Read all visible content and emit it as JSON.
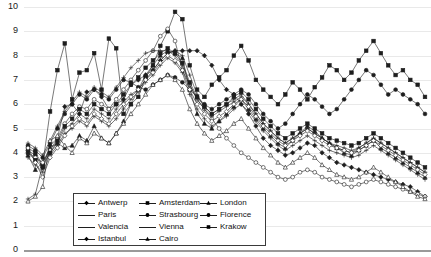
{
  "chart_data": {
    "type": "line",
    "title": "",
    "xlabel": "",
    "ylabel": "",
    "ylim": [
      0,
      10
    ],
    "ytick_values": [
      0,
      1,
      2,
      3,
      4,
      5,
      6,
      7,
      8,
      9,
      10
    ],
    "grid": true,
    "legend_position": "lower-left-inside",
    "x_axis_labels_visible": false,
    "n_points": 55,
    "x": [
      1,
      2,
      3,
      4,
      5,
      6,
      7,
      8,
      9,
      10,
      11,
      12,
      13,
      14,
      15,
      16,
      17,
      18,
      19,
      20,
      21,
      22,
      23,
      24,
      25,
      26,
      27,
      28,
      29,
      30,
      31,
      32,
      33,
      34,
      35,
      36,
      37,
      38,
      39,
      40,
      41,
      42,
      43,
      44,
      45,
      46,
      47,
      48,
      49,
      50,
      51,
      52,
      53,
      54,
      55
    ],
    "series": [
      {
        "name": "Antwerp",
        "marker": "diamond-solid",
        "values": [
          4.1,
          3.9,
          3.4,
          4.3,
          4.6,
          5.9,
          6.0,
          5.6,
          6.5,
          6.6,
          6.3,
          5.8,
          6.0,
          6.2,
          6.8,
          7.0,
          7.2,
          7.4,
          7.8,
          8.1,
          8.2,
          8.2,
          8.2,
          8.2,
          8.0,
          7.6,
          7.0,
          6.6,
          6.4,
          6.0,
          5.6,
          5.1,
          4.6,
          4.3,
          4.1,
          3.9,
          4.0,
          4.2,
          4.4,
          4.3,
          4.0,
          3.8,
          3.6,
          3.5,
          3.4,
          3.3,
          3.2,
          3.1,
          3.0,
          2.9,
          2.8,
          2.7,
          2.6,
          2.4,
          2.2
        ]
      },
      {
        "name": "Amsterdam",
        "marker": "square-solid",
        "values": [
          4.2,
          4.0,
          3.5,
          5.7,
          7.4,
          8.5,
          6.2,
          7.3,
          7.4,
          8.1,
          6.6,
          8.7,
          8.3,
          5.6,
          6.0,
          6.3,
          7.1,
          7.6,
          8.4,
          9.0,
          9.8,
          9.5,
          7.6,
          6.6,
          6.3,
          6.8,
          7.1,
          7.4,
          8.0,
          8.4,
          7.8,
          7.0,
          6.6,
          6.3,
          6.0,
          6.4,
          6.9,
          6.6,
          6.2,
          6.7,
          7.1,
          7.6,
          7.4,
          7.0,
          7.3,
          7.8,
          8.2,
          8.6,
          8.1,
          7.6,
          7.2,
          7.4,
          7.0,
          6.8,
          6.3
        ]
      },
      {
        "name": "London",
        "marker": "triangle-solid",
        "values": [
          3.9,
          3.3,
          3.6,
          4.2,
          4.4,
          4.2,
          4.3,
          4.7,
          4.5,
          5.1,
          4.6,
          4.4,
          4.8,
          5.3,
          6.0,
          6.6,
          7.2,
          7.6,
          8.0,
          8.2,
          8.1,
          7.9,
          6.6,
          5.6,
          5.2,
          5.0,
          5.3,
          5.6,
          5.9,
          6.2,
          5.8,
          5.4,
          5.0,
          4.7,
          4.4,
          4.2,
          4.5,
          4.8,
          5.1,
          4.9,
          4.6,
          4.4,
          4.2,
          4.0,
          3.9,
          4.1,
          4.3,
          4.5,
          4.2,
          4.0,
          3.8,
          3.6,
          3.4,
          3.2,
          3.0
        ]
      },
      {
        "name": "Paris",
        "marker": "plus-line",
        "values": [
          2.1,
          2.3,
          3.5,
          4.0,
          4.4,
          5.0,
          5.2,
          5.6,
          5.4,
          5.8,
          5.6,
          5.4,
          5.8,
          6.1,
          6.4,
          6.6,
          7.0,
          7.4,
          7.8,
          8.1,
          8.2,
          8.0,
          7.2,
          6.4,
          5.9,
          5.6,
          5.8,
          6.0,
          6.2,
          6.4,
          6.0,
          5.6,
          5.2,
          4.9,
          4.6,
          4.4,
          4.6,
          4.8,
          5.0,
          4.8,
          4.6,
          4.4,
          4.2,
          4.1,
          4.0,
          4.2,
          4.4,
          4.6,
          4.4,
          4.2,
          4.0,
          3.8,
          3.6,
          3.4,
          3.2
        ]
      },
      {
        "name": "Strasbourg",
        "marker": "circle-open",
        "values": [
          4.0,
          3.8,
          3.6,
          4.1,
          4.6,
          5.2,
          5.6,
          5.9,
          5.8,
          6.2,
          6.0,
          5.8,
          6.2,
          6.6,
          7.0,
          7.4,
          7.8,
          8.2,
          8.8,
          9.1,
          8.6,
          7.4,
          6.8,
          6.2,
          5.8,
          5.4,
          5.0,
          4.6,
          4.3,
          4.0,
          3.8,
          3.6,
          3.4,
          3.2,
          3.0,
          2.9,
          3.0,
          3.2,
          3.3,
          3.2,
          3.0,
          2.9,
          2.8,
          2.7,
          2.6,
          2.7,
          2.8,
          2.9,
          2.8,
          2.7,
          2.6,
          2.5,
          2.4,
          2.3,
          2.2
        ]
      },
      {
        "name": "Florence",
        "marker": "circle-solid",
        "values": [
          4.3,
          4.1,
          3.8,
          4.4,
          5.0,
          5.6,
          6.0,
          6.4,
          6.2,
          6.6,
          6.4,
          6.2,
          6.6,
          7.0,
          6.9,
          6.7,
          6.6,
          6.8,
          7.0,
          7.2,
          7.1,
          6.9,
          6.6,
          6.3,
          6.0,
          5.8,
          6.0,
          6.2,
          6.4,
          6.6,
          6.4,
          6.0,
          5.6,
          5.3,
          5.0,
          5.2,
          5.6,
          6.0,
          6.4,
          6.2,
          5.9,
          5.6,
          5.8,
          6.2,
          6.6,
          7.0,
          7.4,
          7.2,
          6.8,
          6.4,
          6.6,
          6.4,
          6.2,
          6.0,
          5.6
        ]
      },
      {
        "name": "Valencia",
        "marker": "plus-line2",
        "values": [
          3.8,
          3.5,
          3.2,
          3.9,
          4.3,
          4.8,
          5.0,
          5.3,
          5.1,
          5.5,
          5.3,
          5.1,
          5.4,
          5.8,
          6.2,
          6.5,
          6.9,
          7.2,
          7.6,
          7.9,
          7.7,
          7.3,
          6.4,
          5.8,
          5.4,
          5.1,
          5.3,
          5.5,
          5.8,
          6.0,
          5.7,
          5.3,
          4.9,
          4.6,
          4.3,
          4.1,
          4.3,
          4.5,
          4.7,
          4.5,
          4.3,
          4.1,
          4.0,
          3.9,
          3.8,
          3.9,
          4.1,
          4.3,
          4.1,
          3.9,
          3.7,
          3.5,
          3.3,
          3.1,
          2.9
        ]
      },
      {
        "name": "Vienna",
        "marker": "plus-line3",
        "values": [
          4.4,
          4.2,
          3.9,
          4.5,
          5.1,
          5.7,
          6.1,
          6.5,
          6.3,
          6.7,
          6.5,
          6.3,
          6.7,
          7.1,
          7.5,
          7.8,
          8.1,
          8.2,
          8.2,
          8.2,
          8.0,
          7.6,
          6.8,
          6.2,
          5.8,
          5.5,
          5.7,
          5.9,
          6.1,
          6.3,
          6.0,
          5.6,
          5.2,
          4.9,
          4.6,
          4.4,
          4.6,
          4.8,
          5.0,
          4.8,
          4.6,
          4.4,
          4.3,
          4.2,
          4.1,
          4.2,
          4.4,
          4.6,
          4.4,
          4.2,
          4.0,
          3.8,
          3.6,
          3.4,
          3.2
        ]
      },
      {
        "name": "Krakow",
        "marker": "square-solid2",
        "values": [
          4.0,
          3.7,
          3.4,
          4.0,
          4.5,
          5.1,
          5.4,
          5.8,
          5.6,
          6.0,
          5.8,
          5.6,
          6.0,
          6.4,
          6.8,
          7.1,
          7.5,
          7.8,
          8.1,
          8.3,
          8.1,
          7.7,
          6.9,
          6.3,
          5.9,
          5.6,
          5.8,
          6.0,
          6.3,
          6.5,
          6.2,
          5.8,
          5.4,
          5.1,
          4.8,
          4.6,
          4.8,
          5.0,
          5.2,
          5.0,
          4.8,
          4.6,
          4.5,
          4.4,
          4.3,
          4.4,
          4.6,
          4.8,
          4.6,
          4.4,
          4.2,
          4.0,
          3.8,
          3.6,
          3.4
        ]
      },
      {
        "name": "Istanbul",
        "marker": "diamond-open",
        "values": [
          4.2,
          3.6,
          3.0,
          3.8,
          4.2,
          4.7,
          5.1,
          5.4,
          5.2,
          5.6,
          5.4,
          5.2,
          5.6,
          6.0,
          6.3,
          6.6,
          7.0,
          7.3,
          7.7,
          8.0,
          7.8,
          7.4,
          6.6,
          6.0,
          5.6,
          5.3,
          5.5,
          5.7,
          6.0,
          6.2,
          5.9,
          5.5,
          5.1,
          4.8,
          4.5,
          4.3,
          4.5,
          4.7,
          4.9,
          4.7,
          4.5,
          4.3,
          4.2,
          4.1,
          4.0,
          4.1,
          4.3,
          4.5,
          4.3,
          4.1,
          3.9,
          3.7,
          3.5,
          3.3,
          3.1
        ]
      },
      {
        "name": "Cairo",
        "marker": "triangle-open",
        "values": [
          2.0,
          2.2,
          2.6,
          4.5,
          4.7,
          4.3,
          4.0,
          4.6,
          4.4,
          4.8,
          4.6,
          4.4,
          4.8,
          5.2,
          5.6,
          6.0,
          6.4,
          6.8,
          7.0,
          7.2,
          7.0,
          6.6,
          5.8,
          5.2,
          4.8,
          4.5,
          4.7,
          4.9,
          5.2,
          5.4,
          5.0,
          4.6,
          4.2,
          3.9,
          3.6,
          3.4,
          3.6,
          3.8,
          4.0,
          3.8,
          3.5,
          3.3,
          3.1,
          3.0,
          2.9,
          3.0,
          3.2,
          3.4,
          3.2,
          3.0,
          2.8,
          2.6,
          2.4,
          2.2,
          2.1
        ]
      }
    ]
  },
  "legend": {
    "entries": [
      {
        "label": "Antwerp",
        "marker": "diamond-solid"
      },
      {
        "label": "Amsterdam",
        "marker": "square-solid"
      },
      {
        "label": "London",
        "marker": "triangle-solid"
      },
      {
        "label": "Paris",
        "marker": "plus-line"
      },
      {
        "label": "Strasbourg",
        "marker": "circle-open"
      },
      {
        "label": "Florence",
        "marker": "circle-solid"
      },
      {
        "label": "Valencia",
        "marker": "plus-line2"
      },
      {
        "label": "Vienna",
        "marker": "plus-line3"
      },
      {
        "label": "Krakow",
        "marker": "square-solid2"
      },
      {
        "label": "Istanbul",
        "marker": "diamond-open"
      },
      {
        "label": "Cairo",
        "marker": "triangle-open"
      }
    ]
  },
  "colors": {
    "ink": "#1e1e1e",
    "gridline": "#e9e9e9",
    "axis": "#9a9a9a",
    "background": "#ffffff",
    "legend_border": "#3a3a3a"
  }
}
